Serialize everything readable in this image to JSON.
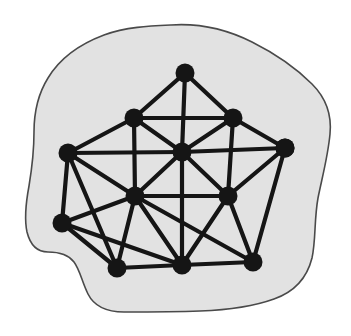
{
  "figure": {
    "kind": "graph-diagram",
    "canvas": {
      "width": 351,
      "height": 336
    },
    "background_color": "#ffffff"
  },
  "region": {
    "name": "enclosing-blob",
    "fill_color": "#e2e2e2",
    "stroke_color": "#4a4a4a",
    "stroke_width": 1.6,
    "outline_path": "M 171 25 C 200 23 228 30 252 42 C 276 54 296 68 312 84 C 326 98 332 114 330 134 C 328 156 322 178 318 198 C 314 220 316 240 312 258 C 307 278 294 292 274 299 C 252 307 226 310 200 311 C 174 312 148 312 124 312 C 106 312 94 306 88 294 C 82 282 80 270 74 262 C 68 254 58 252 48 252 C 37 252 30 244 27 232 C 24 218 26 202 29 186 C 32 168 34 150 34 132 C 34 112 38 94 48 78 C 60 58 80 44 104 35 C 126 27 149 26 171 25 Z"
  },
  "graph_data": {
    "type": "graph",
    "vertex_count": 13,
    "edge_count": 31,
    "vertex_radius": 9.5,
    "vertex_color": "#151515",
    "edge_color": "#151515",
    "edge_width": 4.2,
    "vertices": [
      {
        "id": "v0",
        "label": "top",
        "x": 185,
        "y": 73
      },
      {
        "id": "v1",
        "label": "upper-left",
        "x": 134,
        "y": 118
      },
      {
        "id": "v2",
        "label": "upper-right",
        "x": 233,
        "y": 118
      },
      {
        "id": "v3",
        "label": "center",
        "x": 182,
        "y": 152
      },
      {
        "id": "v4",
        "label": "left",
        "x": 68,
        "y": 153
      },
      {
        "id": "v5",
        "label": "right",
        "x": 285,
        "y": 148
      },
      {
        "id": "v6",
        "label": "mid-left",
        "x": 135,
        "y": 196
      },
      {
        "id": "v7",
        "label": "mid-right",
        "x": 228,
        "y": 196
      },
      {
        "id": "v8",
        "label": "lower-left",
        "x": 62,
        "y": 223
      },
      {
        "id": "v9",
        "label": "bottom-left",
        "x": 117,
        "y": 268
      },
      {
        "id": "v10",
        "label": "bottom-center",
        "x": 182,
        "y": 265
      },
      {
        "id": "v11",
        "label": "bottom-right",
        "x": 253,
        "y": 262
      },
      {
        "id": "v12",
        "label": "right-lower",
        "x": 285,
        "y": 148
      }
    ],
    "edges": [
      {
        "from": "v0",
        "to": "v1"
      },
      {
        "from": "v0",
        "to": "v2"
      },
      {
        "from": "v0",
        "to": "v3"
      },
      {
        "from": "v1",
        "to": "v2"
      },
      {
        "from": "v1",
        "to": "v3"
      },
      {
        "from": "v1",
        "to": "v4"
      },
      {
        "from": "v1",
        "to": "v6"
      },
      {
        "from": "v2",
        "to": "v3"
      },
      {
        "from": "v2",
        "to": "v5"
      },
      {
        "from": "v2",
        "to": "v7"
      },
      {
        "from": "v3",
        "to": "v4"
      },
      {
        "from": "v3",
        "to": "v5"
      },
      {
        "from": "v3",
        "to": "v6"
      },
      {
        "from": "v3",
        "to": "v7"
      },
      {
        "from": "v3",
        "to": "v10"
      },
      {
        "from": "v4",
        "to": "v6"
      },
      {
        "from": "v4",
        "to": "v8"
      },
      {
        "from": "v4",
        "to": "v9"
      },
      {
        "from": "v5",
        "to": "v7"
      },
      {
        "from": "v5",
        "to": "v11"
      },
      {
        "from": "v6",
        "to": "v7"
      },
      {
        "from": "v6",
        "to": "v8"
      },
      {
        "from": "v6",
        "to": "v9"
      },
      {
        "from": "v6",
        "to": "v10"
      },
      {
        "from": "v6",
        "to": "v11"
      },
      {
        "from": "v7",
        "to": "v10"
      },
      {
        "from": "v7",
        "to": "v11"
      },
      {
        "from": "v8",
        "to": "v9"
      },
      {
        "from": "v8",
        "to": "v10"
      },
      {
        "from": "v9",
        "to": "v10"
      },
      {
        "from": "v10",
        "to": "v11"
      }
    ]
  }
}
